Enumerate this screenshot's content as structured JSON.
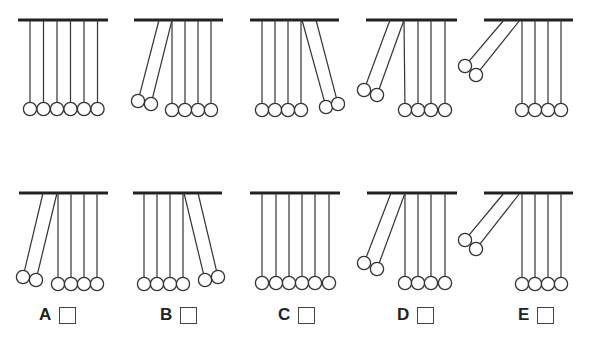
{
  "colors": {
    "bar": "#222222",
    "line": "#333333",
    "ball_fill": "#ffffff"
  },
  "ball_radius": 6.6,
  "bar_y": 20,
  "rows": [
    {
      "name": "sequence",
      "bar_y": 20,
      "panels": [
        {
          "bar": [
            18,
            108
          ],
          "pendulums": [
            {
              "pivot": 30,
              "ball": [
                30,
                109
              ]
            },
            {
              "pivot": 43.5,
              "ball": [
                43.5,
                109
              ]
            },
            {
              "pivot": 57,
              "ball": [
                57,
                109
              ]
            },
            {
              "pivot": 70.5,
              "ball": [
                70.5,
                109
              ]
            },
            {
              "pivot": 84,
              "ball": [
                84,
                109
              ]
            },
            {
              "pivot": 97.5,
              "ball": [
                97.5,
                109
              ]
            }
          ]
        },
        {
          "bar": [
            134,
            223
          ],
          "pendulums": [
            {
              "pivot": 159,
              "ball": [
                138,
                101
              ]
            },
            {
              "pivot": 172,
              "ball": [
                151,
                104
              ]
            },
            {
              "pivot": 172,
              "ball": [
                172,
                110
              ]
            },
            {
              "pivot": 185,
              "ball": [
                185,
                110
              ]
            },
            {
              "pivot": 198,
              "ball": [
                198,
                110
              ]
            },
            {
              "pivot": 211,
              "ball": [
                211,
                110
              ]
            }
          ]
        },
        {
          "bar": [
            250,
            339
          ],
          "pendulums": [
            {
              "pivot": 262,
              "ball": [
                262,
                110
              ]
            },
            {
              "pivot": 275,
              "ball": [
                275,
                110
              ]
            },
            {
              "pivot": 288,
              "ball": [
                288,
                110
              ]
            },
            {
              "pivot": 301,
              "ball": [
                301,
                110
              ]
            },
            {
              "pivot": 302,
              "ball": [
                326,
                107
              ]
            },
            {
              "pivot": 316,
              "ball": [
                338,
                104
              ]
            }
          ]
        },
        {
          "bar": [
            366,
            457
          ],
          "pendulums": [
            {
              "pivot": 390,
              "ball": [
                364,
                90
              ]
            },
            {
              "pivot": 404,
              "ball": [
                377,
                95
              ]
            },
            {
              "pivot": 404,
              "ball": [
                405,
                110
              ]
            },
            {
              "pivot": 418,
              "ball": [
                418,
                110
              ]
            },
            {
              "pivot": 431,
              "ball": [
                431,
                110
              ]
            },
            {
              "pivot": 445,
              "ball": [
                445,
                110
              ]
            }
          ]
        },
        {
          "bar": [
            484,
            573
          ],
          "pendulums": [
            {
              "pivot": 504,
              "ball": [
                465,
                66
              ]
            },
            {
              "pivot": 520,
              "ball": [
                476,
                75
              ]
            },
            {
              "pivot": 522,
              "ball": [
                522,
                110
              ]
            },
            {
              "pivot": 535,
              "ball": [
                535,
                110
              ]
            },
            {
              "pivot": 548,
              "ball": [
                548,
                110
              ]
            },
            {
              "pivot": 561,
              "ball": [
                561,
                110
              ]
            }
          ]
        }
      ]
    },
    {
      "name": "options",
      "bar_y": 193,
      "panels": [
        {
          "bar": [
            19,
            108
          ],
          "pendulums": [
            {
              "pivot": 43,
              "ball": [
                23,
                277
              ]
            },
            {
              "pivot": 57,
              "ball": [
                36,
                280
              ]
            },
            {
              "pivot": 58,
              "ball": [
                58,
                284
              ]
            },
            {
              "pivot": 71,
              "ball": [
                71,
                284
              ]
            },
            {
              "pivot": 84,
              "ball": [
                84,
                284
              ]
            },
            {
              "pivot": 97,
              "ball": [
                97,
                284
              ]
            }
          ]
        },
        {
          "bar": [
            133,
            222
          ],
          "pendulums": [
            {
              "pivot": 144,
              "ball": [
                144,
                284
              ]
            },
            {
              "pivot": 157,
              "ball": [
                157,
                284
              ]
            },
            {
              "pivot": 170,
              "ball": [
                170,
                284
              ]
            },
            {
              "pivot": 183,
              "ball": [
                183,
                284
              ]
            },
            {
              "pivot": 184,
              "ball": [
                205,
                280
              ]
            },
            {
              "pivot": 198,
              "ball": [
                218,
                277
              ]
            }
          ]
        },
        {
          "bar": [
            250,
            340
          ],
          "pendulums": [
            {
              "pivot": 262,
              "ball": [
                262,
                283
              ]
            },
            {
              "pivot": 276,
              "ball": [
                276,
                283
              ]
            },
            {
              "pivot": 289,
              "ball": [
                289,
                283
              ]
            },
            {
              "pivot": 302,
              "ball": [
                302,
                283
              ]
            },
            {
              "pivot": 315,
              "ball": [
                315,
                283
              ]
            },
            {
              "pivot": 329,
              "ball": [
                329,
                283
              ]
            }
          ]
        },
        {
          "bar": [
            367,
            457
          ],
          "pendulums": [
            {
              "pivot": 391,
              "ball": [
                364,
                263
              ]
            },
            {
              "pivot": 405,
              "ball": [
                377,
                269
              ]
            },
            {
              "pivot": 405,
              "ball": [
                405,
                283
              ]
            },
            {
              "pivot": 418,
              "ball": [
                418,
                283
              ]
            },
            {
              "pivot": 431,
              "ball": [
                431,
                283
              ]
            },
            {
              "pivot": 445,
              "ball": [
                445,
                283
              ]
            }
          ]
        },
        {
          "bar": [
            484,
            573
          ],
          "pendulums": [
            {
              "pivot": 504,
              "ball": [
                465,
                240
              ]
            },
            {
              "pivot": 520,
              "ball": [
                476,
                249
              ]
            },
            {
              "pivot": 522,
              "ball": [
                522,
                284
              ]
            },
            {
              "pivot": 535,
              "ball": [
                535,
                284
              ]
            },
            {
              "pivot": 548,
              "ball": [
                548,
                284
              ]
            },
            {
              "pivot": 561,
              "ball": [
                561,
                284
              ]
            }
          ]
        }
      ]
    }
  ],
  "options": [
    {
      "letter": "A",
      "x": 39,
      "y": 305,
      "checked": false
    },
    {
      "letter": "B",
      "x": 160,
      "y": 305,
      "checked": false
    },
    {
      "letter": "C",
      "x": 278,
      "y": 305,
      "checked": false
    },
    {
      "letter": "D",
      "x": 397,
      "y": 305,
      "checked": false
    },
    {
      "letter": "E",
      "x": 518,
      "y": 305,
      "checked": false
    }
  ]
}
